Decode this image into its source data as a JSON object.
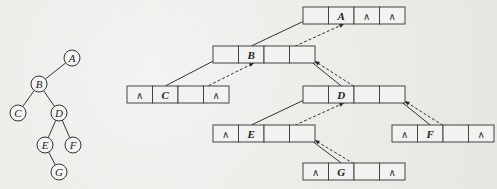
{
  "tree": {
    "nodes": [
      {
        "id": "A",
        "label": "A",
        "x": 72,
        "y": 58
      },
      {
        "id": "B",
        "label": "B",
        "x": 39,
        "y": 84
      },
      {
        "id": "C",
        "label": "C",
        "x": 18,
        "y": 113
      },
      {
        "id": "D",
        "label": "D",
        "x": 59,
        "y": 113
      },
      {
        "id": "E",
        "label": "E",
        "x": 45,
        "y": 145
      },
      {
        "id": "F",
        "label": "F",
        "x": 73,
        "y": 145
      },
      {
        "id": "G",
        "label": "G",
        "x": 59,
        "y": 172
      }
    ],
    "edges": [
      [
        "A",
        "B"
      ],
      [
        "B",
        "C"
      ],
      [
        "B",
        "D"
      ],
      [
        "D",
        "E"
      ],
      [
        "D",
        "F"
      ],
      [
        "E",
        "G"
      ]
    ]
  },
  "linked": {
    "null_symbol": "∧",
    "nodes": [
      {
        "id": "A",
        "x": 303,
        "y": 7,
        "cells": [
          "",
          "A",
          "∧",
          "∧"
        ]
      },
      {
        "id": "B",
        "x": 213,
        "y": 46,
        "cells": [
          "",
          "B",
          "",
          ""
        ]
      },
      {
        "id": "C",
        "x": 127,
        "y": 86,
        "cells": [
          "∧",
          "C",
          "",
          "∧"
        ]
      },
      {
        "id": "D",
        "x": 303,
        "y": 86,
        "cells": [
          "",
          "D",
          "",
          ""
        ]
      },
      {
        "id": "E",
        "x": 213,
        "y": 125,
        "cells": [
          "∧",
          "E",
          "",
          ""
        ]
      },
      {
        "id": "F",
        "x": 392,
        "y": 125,
        "cells": [
          "∧",
          "F",
          "",
          "∧"
        ]
      },
      {
        "id": "G",
        "x": 303,
        "y": 163,
        "cells": [
          "∧",
          "G",
          "",
          "∧"
        ]
      }
    ],
    "child_links": [
      {
        "from": "A",
        "to": "B"
      },
      {
        "from": "B",
        "to": "C"
      },
      {
        "from": "B",
        "to": "D"
      },
      {
        "from": "D",
        "to": "E"
      },
      {
        "from": "D",
        "to": "F"
      },
      {
        "from": "E",
        "to": "G"
      }
    ],
    "parent_links": [
      {
        "from": "B",
        "to": "A"
      },
      {
        "from": "C",
        "to": "B"
      },
      {
        "from": "D",
        "to": "B"
      },
      {
        "from": "E",
        "to": "D"
      },
      {
        "from": "F",
        "to": "D"
      },
      {
        "from": "G",
        "to": "E"
      }
    ]
  }
}
